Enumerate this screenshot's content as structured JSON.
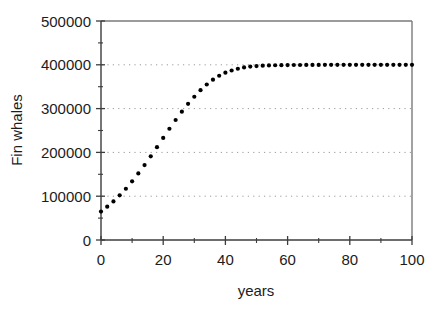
{
  "chart_data": {
    "type": "scatter",
    "title": "",
    "subtitle": "",
    "xlabel": "years",
    "ylabel": "Fin whales",
    "xlim": [
      0,
      100
    ],
    "ylim": [
      0,
      500000
    ],
    "grid": true,
    "grid_axis": "y",
    "grid_style": "dotted",
    "legend": null,
    "legend_position": "none",
    "marker": "filled-circle",
    "marker_color": "#000000",
    "marker_size_px": 4.2,
    "x_major_ticks": [
      0,
      20,
      40,
      60,
      80,
      100
    ],
    "x_minor_ticks": [
      10,
      30,
      50,
      70,
      90
    ],
    "x_tick_labels": [
      "0",
      "20",
      "40",
      "60",
      "80",
      "100"
    ],
    "y_major_ticks": [
      0,
      100000,
      200000,
      300000,
      400000,
      500000
    ],
    "y_minor_ticks": [
      50000,
      150000,
      250000,
      350000,
      450000
    ],
    "y_tick_labels": [
      "0",
      "100000",
      "200000",
      "300000",
      "400000",
      "500000"
    ],
    "model": "logistic growth",
    "carrying_capacity": 400000,
    "initial_value": 65000,
    "growth_rate": 0.105,
    "x": [
      0,
      2,
      4,
      6,
      8,
      10,
      12,
      14,
      16,
      18,
      20,
      22,
      24,
      26,
      28,
      30,
      32,
      34,
      36,
      38,
      40,
      42,
      44,
      46,
      48,
      50,
      52,
      54,
      56,
      58,
      60,
      62,
      64,
      66,
      68,
      70,
      72,
      74,
      76,
      78,
      80,
      82,
      84,
      86,
      88,
      90,
      92,
      94,
      96,
      98,
      100
    ],
    "values": [
      65000,
      77800,
      92600,
      109600,
      128900,
      150500,
      174200,
      199800,
      226800,
      254500,
      282000,
      308300,
      332500,
      354000,
      372300,
      387300,
      399200,
      408400,
      415400,
      420500,
      424200,
      426900,
      428800,
      430100,
      431000,
      431700,
      432100,
      432400,
      432600,
      432800,
      432900,
      432900,
      433000,
      433000,
      433000,
      433000,
      433000,
      433000,
      433000,
      433000,
      433000,
      433000,
      433000,
      433000,
      433000,
      433000,
      433000,
      433000,
      433000,
      433000,
      433000
    ],
    "series": [
      {
        "name": "Fin whales",
        "x": [
          0,
          2,
          4,
          6,
          8,
          10,
          12,
          14,
          16,
          18,
          20,
          22,
          24,
          26,
          28,
          30,
          32,
          34,
          36,
          38,
          40,
          42,
          44,
          46,
          48,
          50,
          52,
          54,
          56,
          58,
          60,
          62,
          64,
          66,
          68,
          70,
          72,
          74,
          76,
          78,
          80,
          82,
          84,
          86,
          88,
          90,
          92,
          94,
          96,
          98,
          100
        ],
        "values": [
          65000,
          76000,
          88000,
          102000,
          117000,
          134000,
          152000,
          171000,
          191000,
          212000,
          233000,
          254000,
          274000,
          293000,
          311000,
          327000,
          342000,
          355000,
          366000,
          375000,
          382000,
          387000,
          391000,
          394000,
          396000,
          397000,
          398000,
          398500,
          399000,
          399200,
          399400,
          399500,
          399600,
          399700,
          399800,
          399800,
          399900,
          399900,
          399900,
          399900,
          400000,
          400000,
          400000,
          400000,
          400000,
          400000,
          400000,
          400000,
          400000,
          400000,
          400000
        ]
      }
    ],
    "annotations": []
  },
  "axes": {
    "x_label": "years",
    "y_label": "Fin whales"
  }
}
